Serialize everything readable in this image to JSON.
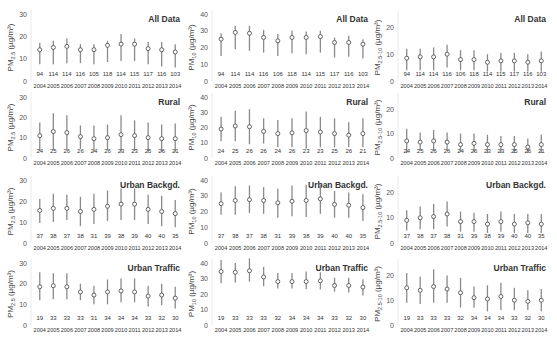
{
  "figure": {
    "row_titles": [
      "All Data",
      "Rural",
      "Urban Backgd.",
      "Urban Traffic"
    ],
    "column_ylabels": [
      {
        "main": "PM",
        "sub": "2.5",
        "unit": " (µg/m³)"
      },
      {
        "main": "PM",
        "sub": "10",
        "unit": " (µg/m³)"
      },
      {
        "main": "PM",
        "sub": "2.5-10",
        "unit": " (µg/m³)"
      }
    ],
    "years": [
      "2004",
      "2005",
      "2006",
      "2007",
      "2008",
      "2009",
      "2010",
      "2011",
      "2012",
      "2013",
      "2014"
    ]
  },
  "chart_data": [
    {
      "type": "scatter",
      "title": "All Data",
      "ylabel": "PM2.5 (µg/m³)",
      "ylim": [
        0,
        30
      ],
      "yticks": [
        0,
        10,
        20,
        30
      ],
      "categories": [
        "2004",
        "2005",
        "2006",
        "2007",
        "2008",
        "2009",
        "2010",
        "2011",
        "2012",
        "2013",
        "2014"
      ],
      "values": [
        14,
        15,
        15.5,
        14,
        14,
        16,
        16.5,
        16.5,
        14.5,
        14,
        13
      ],
      "err_low": [
        7.5,
        7.5,
        8,
        8,
        7.5,
        8.5,
        9,
        9,
        7.5,
        6.5,
        6
      ],
      "err_high": [
        17,
        18,
        19,
        16.5,
        16.5,
        18,
        21,
        19,
        17.5,
        17.5,
        16.5
      ],
      "n": [
        94,
        114,
        114,
        116,
        105,
        118,
        114,
        115,
        117,
        116,
        103
      ]
    },
    {
      "type": "scatter",
      "title": "All Data",
      "ylabel": "PM10 (µg/m³)",
      "ylim": [
        0,
        40
      ],
      "yticks": [
        0,
        10,
        20,
        30,
        40
      ],
      "categories": [
        "2004",
        "2005",
        "2006",
        "2007",
        "2008",
        "2009",
        "2010",
        "2011",
        "2012",
        "2013",
        "2014"
      ],
      "values": [
        25,
        29,
        28.5,
        26,
        24,
        26,
        26,
        26.5,
        23,
        23,
        22
      ],
      "err_low": [
        15,
        19,
        18,
        17,
        15,
        16.5,
        16,
        17,
        14,
        14.5,
        13.5
      ],
      "err_high": [
        28.5,
        33,
        33,
        30.5,
        28,
        30,
        29.5,
        30,
        26,
        27,
        25
      ],
      "n": [
        94,
        114,
        114,
        116,
        106,
        118,
        114,
        115,
        117,
        116,
        103
      ]
    },
    {
      "type": "scatter",
      "title": "All Data",
      "ylabel": "PM2.5-10 (µg/m³)",
      "ylim": [
        0,
        25
      ],
      "yticks": [
        0,
        10,
        20
      ],
      "categories": [
        "2004",
        "2005",
        "2006",
        "2007",
        "2008",
        "2009",
        "2010",
        "2011",
        "2012",
        "2013",
        "2014"
      ],
      "values": [
        8.5,
        9,
        9,
        10,
        8,
        8,
        7,
        7.5,
        7.5,
        7,
        7.5
      ],
      "err_low": [
        4,
        4,
        4,
        5,
        4,
        4,
        3.5,
        3.5,
        3.5,
        3.5,
        3.5
      ],
      "err_high": [
        12,
        12,
        12.5,
        13.5,
        11.5,
        11.5,
        10,
        10.5,
        10.5,
        10,
        11
      ],
      "n": [
        94,
        114,
        114,
        116,
        106,
        118,
        114,
        115,
        117,
        116,
        103
      ]
    },
    {
      "type": "scatter",
      "title": "Rural",
      "ylabel": "PM2.5 (µg/m³)",
      "ylim": [
        0,
        30
      ],
      "yticks": [
        0,
        10,
        20,
        30
      ],
      "categories": [
        "2004",
        "2005",
        "2006",
        "2007",
        "2008",
        "2009",
        "2010",
        "2011",
        "2012",
        "2013",
        "2014"
      ],
      "values": [
        11,
        13,
        12.5,
        10.5,
        9.5,
        10,
        11.5,
        11,
        10,
        9.5,
        9.5
      ],
      "err_low": [
        3.5,
        4,
        4,
        4.5,
        3,
        4,
        3,
        3.5,
        3,
        3,
        3
      ],
      "err_high": [
        17.5,
        22,
        21,
        16,
        16,
        16.5,
        21,
        18.5,
        17.5,
        16.5,
        17
      ],
      "n": [
        24,
        25,
        26,
        26,
        24,
        26,
        23,
        23,
        25,
        26,
        21
      ]
    },
    {
      "type": "scatter",
      "title": "Rural",
      "ylabel": "PM10 (µg/m³)",
      "ylim": [
        0,
        40
      ],
      "yticks": [
        0,
        10,
        20,
        30,
        40
      ],
      "categories": [
        "2004",
        "2005",
        "2006",
        "2007",
        "2008",
        "2009",
        "2010",
        "2011",
        "2012",
        "2013",
        "2014"
      ],
      "values": [
        19,
        21,
        20.5,
        17.5,
        16,
        16.5,
        18,
        17,
        16,
        15,
        16
      ],
      "err_low": [
        11,
        11,
        9,
        9.5,
        7,
        7,
        6,
        7,
        7,
        7,
        7
      ],
      "err_high": [
        27,
        31,
        32,
        26,
        25,
        26,
        30.5,
        27,
        26,
        23.5,
        26
      ],
      "n": [
        24,
        25,
        26,
        26,
        24,
        26,
        23,
        23,
        25,
        26,
        21
      ]
    },
    {
      "type": "scatter",
      "title": "Rural",
      "ylabel": "PM2.5-10 (µg/m³)",
      "ylim": [
        0,
        25
      ],
      "yticks": [
        0,
        10,
        20
      ],
      "categories": [
        "2004",
        "2005",
        "2006",
        "2007",
        "2008",
        "2009",
        "2010",
        "2011",
        "2012",
        "2013",
        "2014"
      ],
      "values": [
        7,
        6.5,
        7,
        6.5,
        5.5,
        6,
        5.5,
        5.5,
        5.5,
        4.5,
        5.5
      ],
      "err_low": [
        2,
        3,
        3,
        3,
        2.5,
        2.5,
        2,
        2,
        2,
        2,
        2
      ],
      "err_high": [
        12,
        10.5,
        11.5,
        10.5,
        10,
        10,
        9.5,
        9,
        9,
        8,
        9.5
      ],
      "n": [
        24,
        25,
        26,
        26,
        24,
        26,
        23,
        23,
        25,
        26,
        21
      ]
    },
    {
      "type": "scatter",
      "title": "Urban Backgd.",
      "ylabel": "PM2.5 (µg/m³)",
      "ylim": [
        0,
        30
      ],
      "yticks": [
        0,
        10,
        20,
        30
      ],
      "categories": [
        "2004",
        "2005",
        "2006",
        "2007",
        "2008",
        "2009",
        "2010",
        "2011",
        "2012",
        "2013",
        "2014"
      ],
      "values": [
        15.5,
        16.5,
        16.5,
        15,
        16,
        17.5,
        18.5,
        18.5,
        16,
        15,
        14
      ],
      "err_low": [
        9.5,
        10,
        11,
        8,
        9,
        10.5,
        11,
        11,
        9,
        8,
        7.5
      ],
      "err_high": [
        21,
        23.5,
        23,
        22,
        23.5,
        25,
        26,
        26,
        23,
        22.5,
        20.5
      ],
      "n": [
        37,
        38,
        37,
        38,
        31,
        39,
        38,
        39,
        40,
        40,
        35
      ]
    },
    {
      "type": "scatter",
      "title": "Urban Backgd.",
      "ylabel": "PM10 (µg/m³)",
      "ylim": [
        0,
        40
      ],
      "yticks": [
        0,
        10,
        20,
        30,
        40
      ],
      "categories": [
        "2004",
        "2005",
        "2006",
        "2007",
        "2008",
        "2009",
        "2010",
        "2011",
        "2012",
        "2013",
        "2014"
      ],
      "values": [
        25,
        27,
        27.5,
        27,
        25.5,
        26.5,
        27,
        28,
        24.5,
        24,
        22.5
      ],
      "err_low": [
        18,
        18,
        19,
        18.5,
        16,
        17,
        16.5,
        18.5,
        16,
        16,
        14
      ],
      "err_high": [
        32,
        36,
        36.5,
        35.5,
        34.5,
        36.5,
        37,
        37,
        33,
        32,
        31
      ],
      "n": [
        37,
        38,
        37,
        38,
        31,
        39,
        38,
        39,
        40,
        40,
        35
      ]
    },
    {
      "type": "scatter",
      "title": "Urban Backgd.",
      "ylabel": "PM2.5-10 (µg/m³)",
      "ylim": [
        0,
        25
      ],
      "yticks": [
        0,
        10,
        20
      ],
      "categories": [
        "2004",
        "2005",
        "2006",
        "2007",
        "2008",
        "2009",
        "2010",
        "2011",
        "2012",
        "2013",
        "2014"
      ],
      "values": [
        9,
        10,
        10.5,
        11.5,
        8.5,
        8.5,
        7.5,
        8.5,
        7.5,
        8,
        7.5
      ],
      "err_low": [
        5,
        5.5,
        5.5,
        6.5,
        4.5,
        4.5,
        4,
        4.5,
        4,
        4,
        4
      ],
      "err_high": [
        13,
        14.5,
        15.5,
        16.5,
        12.5,
        12,
        11.5,
        12.5,
        11.5,
        11.5,
        11.5
      ],
      "n": [
        37,
        38,
        37,
        38,
        31,
        39,
        38,
        39,
        40,
        40,
        35
      ]
    },
    {
      "type": "scatter",
      "title": "Urban Traffic",
      "ylabel": "PM2.5 (µg/m³)",
      "ylim": [
        0,
        30
      ],
      "yticks": [
        0,
        10,
        20,
        30
      ],
      "categories": [
        "2004",
        "2005",
        "2006",
        "2007",
        "2008",
        "2009",
        "2010",
        "2011",
        "2012",
        "2013",
        "2014"
      ],
      "values": [
        18.5,
        19,
        18.5,
        16,
        14.5,
        16,
        16.5,
        16,
        14,
        14.5,
        13
      ],
      "err_low": [
        12,
        12.5,
        12.5,
        12,
        10,
        10,
        11,
        11,
        9,
        9.5,
        8
      ],
      "err_high": [
        25.5,
        25,
        25,
        20,
        19,
        22,
        22.5,
        22.5,
        19,
        20,
        18.5
      ],
      "n": [
        19,
        33,
        33,
        33,
        31,
        34,
        34,
        34,
        33,
        32,
        30
      ]
    },
    {
      "type": "scatter",
      "title": "Urban Traffic",
      "ylabel": "PM10 (µg/m³)",
      "ylim": [
        0,
        40
      ],
      "yticks": [
        0,
        10,
        20,
        30,
        40
      ],
      "categories": [
        "2004",
        "2005",
        "2006",
        "2007",
        "2008",
        "2009",
        "2010",
        "2011",
        "2012",
        "2013",
        "2014"
      ],
      "values": [
        34.5,
        34,
        35,
        31,
        28,
        28,
        28,
        28.5,
        25.5,
        25.5,
        24.5
      ],
      "err_low": [
        27,
        27.5,
        28,
        25,
        23.5,
        23.5,
        23,
        23,
        21.5,
        21,
        19
      ],
      "err_high": [
        42,
        40,
        43,
        37.5,
        33.5,
        33.5,
        34.5,
        34,
        30.5,
        30.5,
        29.5
      ],
      "n": [
        19,
        33,
        33,
        33,
        32,
        34,
        34,
        34,
        33,
        32,
        30
      ]
    },
    {
      "type": "scatter",
      "title": "Urban Traffic",
      "ylabel": "PM2.5-10 (µg/m³)",
      "ylim": [
        0,
        25
      ],
      "yticks": [
        0,
        10,
        20
      ],
      "categories": [
        "2004",
        "2005",
        "2006",
        "2007",
        "2008",
        "2009",
        "2010",
        "2011",
        "2012",
        "2013",
        "2014"
      ],
      "values": [
        15,
        14,
        15.5,
        14.5,
        13,
        11,
        10.5,
        11.5,
        10,
        9.5,
        10
      ],
      "err_low": [
        9,
        8.5,
        9,
        9,
        7,
        7,
        5.5,
        6,
        6,
        6,
        5.5
      ],
      "err_high": [
        21,
        19.5,
        22.5,
        20,
        19,
        15.5,
        16,
        17,
        15,
        14,
        14.5
      ],
      "n": [
        19,
        33,
        33,
        33,
        32,
        34,
        34,
        34,
        33,
        32,
        30
      ]
    }
  ]
}
